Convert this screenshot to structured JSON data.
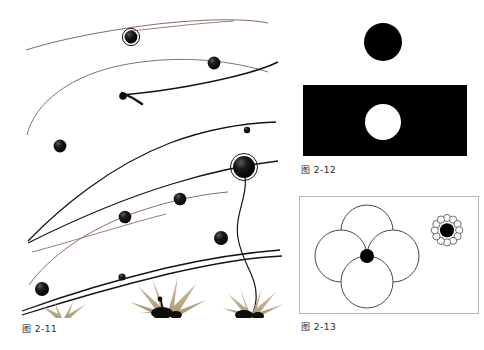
{
  "page": {
    "background_color": "#ffffff",
    "text_color": "#2b2b2b",
    "kind": "textbook-figure-page"
  },
  "figures": [
    {
      "id": "fig-2-11",
      "caption": "图 2-11",
      "description": "Stylized illustration of swooping curved lines with round black dots of varying size and tan plant silhouettes along the bottom edge",
      "colors": {
        "brown_line": "#8a7066",
        "black_line": "#111111",
        "dot": "#0b0b0b",
        "plant": "#bfae8e"
      },
      "dot_count": 12,
      "line_count": 10
    },
    {
      "id": "fig-2-12",
      "caption": "图 2-12",
      "description": "A solid black disc on white above a solid black rectangle containing a white disc",
      "colors": {
        "fill": "#000000",
        "hole": "#ffffff"
      },
      "shapes": [
        {
          "name": "black-disc-on-white",
          "radius": 19
        },
        {
          "name": "black-rectangle",
          "width": 164,
          "height": 71
        },
        {
          "name": "white-disc-in-black",
          "radius": 18
        }
      ]
    },
    {
      "id": "fig-2-13",
      "caption": "图 2-13",
      "description": "Four large outlined circles arranged in a diamond with a small black dot at the center, and a separate small black dot encircled by a ring of tiny circles",
      "colors": {
        "outline": "#4a4a4a",
        "dot": "#000000",
        "border": "#b8b8b8"
      },
      "shapes": [
        {
          "name": "circle-top",
          "radius": 26
        },
        {
          "name": "circle-left",
          "radius": 26
        },
        {
          "name": "circle-right",
          "radius": 26
        },
        {
          "name": "circle-bottom",
          "radius": 26
        },
        {
          "name": "center-dot",
          "radius": 7
        },
        {
          "name": "dot-ring-cluster",
          "ring_count": 12,
          "dot_radius": 7
        }
      ]
    }
  ]
}
